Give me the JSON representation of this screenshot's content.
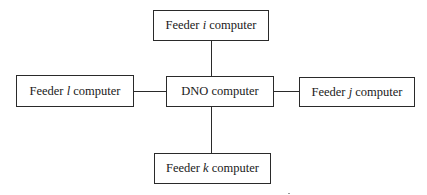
{
  "diagram": {
    "type": "star-topology",
    "center": {
      "id": "dno",
      "label": "DNO computer"
    },
    "nodes": [
      {
        "id": "feeder-i",
        "prefix": "Feeder ",
        "var": "i",
        "suffix": " computer",
        "position": "top"
      },
      {
        "id": "feeder-l",
        "prefix": "Feeder ",
        "var": "l",
        "suffix": " computer",
        "position": "left"
      },
      {
        "id": "feeder-j",
        "prefix": "Feeder ",
        "var": "j",
        "suffix": " computer",
        "position": "right"
      },
      {
        "id": "feeder-k",
        "prefix": "Feeder ",
        "var": "k",
        "suffix": " computer",
        "position": "bottom"
      }
    ],
    "edges": [
      [
        "dno",
        "feeder-i"
      ],
      [
        "dno",
        "feeder-l"
      ],
      [
        "dno",
        "feeder-j"
      ],
      [
        "dno",
        "feeder-k"
      ]
    ]
  }
}
